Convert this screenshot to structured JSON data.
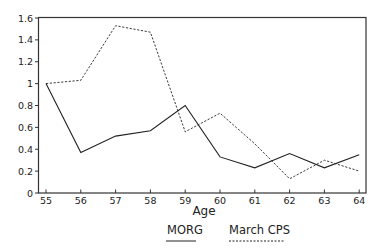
{
  "chart_data": {
    "type": "line",
    "title": "",
    "xlabel": "Age",
    "ylabel": "",
    "x": [
      55,
      56,
      57,
      58,
      59,
      60,
      61,
      62,
      63,
      64
    ],
    "series": [
      {
        "name": "MORG",
        "style": "solid",
        "values": [
          1.0,
          0.37,
          0.52,
          0.57,
          0.8,
          0.33,
          0.23,
          0.36,
          0.23,
          0.35
        ]
      },
      {
        "name": "March CPS",
        "style": "dashed",
        "values": [
          1.0,
          1.03,
          1.53,
          1.47,
          0.56,
          0.73,
          0.45,
          0.13,
          0.3,
          0.2
        ]
      }
    ],
    "ylim": [
      0,
      1.6
    ],
    "yticks": [
      "0",
      "0.2",
      "0.4",
      "0.6",
      "0.8",
      "1",
      "1.2",
      "1.4",
      "1.6"
    ],
    "xticks": [
      "55",
      "56",
      "57",
      "58",
      "59",
      "60",
      "61",
      "62",
      "63",
      "64"
    ],
    "grid": false,
    "legend_position": "bottom",
    "colors": {
      "line": "#222222",
      "axis": "#333333"
    }
  },
  "legend": {
    "items": [
      {
        "label": "MORG",
        "style": "solid"
      },
      {
        "label": "March CPS",
        "style": "dashed"
      }
    ]
  }
}
